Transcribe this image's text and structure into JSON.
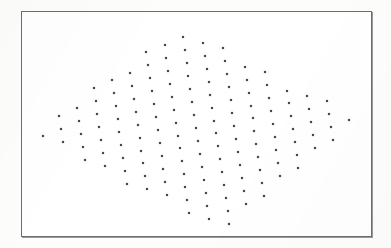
{
  "figure": {
    "title": "",
    "width": 391,
    "height": 248,
    "background_color": "#fdfdfc",
    "plot_background_color": "#ffffff"
  },
  "frame": {
    "name": "plot-border",
    "left": 21,
    "top": 11,
    "width": 351,
    "height": 226,
    "border_width": 1,
    "border_color": "#6e6e70",
    "shadow_color": "#9a9a9c"
  },
  "chart_data": {
    "type": "scatter",
    "title": "",
    "subtitle": "",
    "xlabel": "",
    "ylabel": "",
    "grid": false,
    "legend": null,
    "legend_position": "none",
    "axis_ticks": false,
    "axis_tick_labels": [],
    "xlim": [
      21,
      372
    ],
    "ylim": [
      11,
      237
    ],
    "marker": {
      "shape": "square",
      "size_px": 2.2,
      "color": "#3a3a3c",
      "edge_color": "#2a2a2c",
      "opacity": 0.92
    },
    "lattice": {
      "origin_x": 196.0,
      "origin_y": 128.0,
      "vector_a": [
        1.9,
        12.95
      ],
      "vector_b": [
        20.1,
        5.45
      ],
      "index_i_range": [
        -9,
        9
      ],
      "index_j_range": [
        -9,
        9
      ]
    },
    "envelope": {
      "shape": "rhombus",
      "vertices": [
        [
          178,
          24
        ],
        [
          366,
          119
        ],
        [
          224,
          231
        ],
        [
          28,
          136
        ]
      ],
      "center": [
        196,
        128
      ]
    },
    "point_count": 241,
    "points_note": "Every point is generated as origin + i*vector_a + j*vector_b and retained only when it falls inside the rhombus envelope."
  }
}
